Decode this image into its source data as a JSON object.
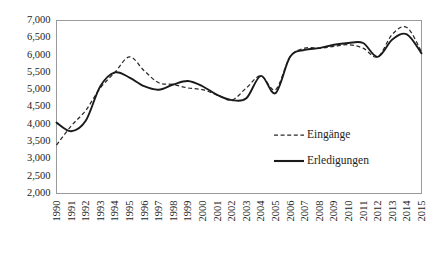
{
  "chart_data": {
    "type": "line",
    "title": "",
    "subtitle": "",
    "xlabel": "",
    "ylabel": "",
    "grid": false,
    "legend_position": "inside-center-right",
    "xlim": [
      1990,
      2015
    ],
    "ylim": [
      2000,
      7000
    ],
    "ytick_step": 500,
    "x": [
      1990,
      1991,
      1992,
      1993,
      1994,
      1995,
      1996,
      1997,
      1998,
      1999,
      2000,
      2001,
      2002,
      2003,
      2004,
      2005,
      2006,
      2007,
      2008,
      2009,
      2010,
      2011,
      2012,
      2013,
      2014,
      2015
    ],
    "xticklabels": [
      "1990",
      "1991",
      "1992",
      "1993",
      "1994",
      "1995",
      "1996",
      "1997",
      "1998",
      "1999",
      "2000",
      "2001",
      "2002",
      "2003",
      "2004",
      "2005",
      "2006",
      "2007",
      "2008",
      "2009",
      "2010",
      "2011",
      "2012",
      "2013",
      "2014",
      "2015"
    ],
    "yticklabels": [
      "2,000",
      "2,500",
      "3,000",
      "3,500",
      "4,000",
      "4,500",
      "5,000",
      "5,500",
      "6,000",
      "6,500",
      "7,000"
    ],
    "series": [
      {
        "name": "Eingänge",
        "style": "dashed",
        "color": "#2a2a2a",
        "values": [
          3400,
          3950,
          4400,
          5050,
          5500,
          5950,
          5550,
          5200,
          5150,
          5050,
          5000,
          4850,
          4700,
          5050,
          5400,
          5000,
          5950,
          6200,
          6200,
          6250,
          6300,
          6200,
          5950,
          6600,
          6800,
          6100
        ]
      },
      {
        "name": "Erledigungen",
        "style": "solid",
        "color": "#1a1a1a",
        "values": [
          4050,
          3800,
          4100,
          5100,
          5500,
          5350,
          5100,
          5000,
          5150,
          5250,
          5100,
          4850,
          4700,
          4750,
          5400,
          4900,
          5950,
          6150,
          6200,
          6300,
          6350,
          6350,
          5950,
          6450,
          6600,
          6050
        ]
      }
    ],
    "legend": [
      {
        "label": "Eingänge",
        "style": "dashed"
      },
      {
        "label": "Erledigungen",
        "style": "solid"
      }
    ]
  }
}
